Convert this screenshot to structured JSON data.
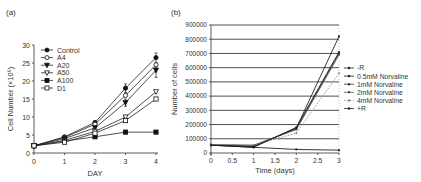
{
  "chart_data": [
    {
      "panel": "(a)",
      "type": "line",
      "title": "",
      "xlabel": "DAY",
      "ylabel": "Cell Number (×10⁶)",
      "x": [
        0,
        1,
        2,
        3,
        4
      ],
      "xticks": [
        "0",
        "1",
        "2",
        "3",
        "4"
      ],
      "yticks": [
        "0",
        "5",
        "10",
        "15",
        "20",
        "25",
        "30"
      ],
      "ylim": [
        0,
        30
      ],
      "xlim": [
        0,
        4
      ],
      "grid": false,
      "legend_position": "upper-left-inside",
      "series": [
        {
          "name": "Control",
          "marker": "filled-circle",
          "values": [
            2,
            4.5,
            8.5,
            18,
            26.5
          ]
        },
        {
          "name": "A4",
          "marker": "open-circle",
          "values": [
            2,
            4.3,
            8,
            16,
            24.5
          ]
        },
        {
          "name": "A20",
          "marker": "filled-triangle-down",
          "values": [
            2,
            4,
            7,
            14,
            23
          ]
        },
        {
          "name": "A50",
          "marker": "open-triangle-down",
          "values": [
            2,
            3.5,
            6,
            10,
            17
          ]
        },
        {
          "name": "A100",
          "marker": "filled-square",
          "values": [
            2,
            3.3,
            4.5,
            5.8,
            5.8
          ]
        },
        {
          "name": "D1",
          "marker": "open-square",
          "values": [
            2,
            3,
            5.5,
            9,
            15
          ]
        }
      ]
    },
    {
      "panel": "(b)",
      "type": "line",
      "title": "",
      "xlabel": "Time (days)",
      "ylabel": "Number of cells",
      "x": [
        0,
        1,
        2,
        3
      ],
      "xticks": [
        "0",
        "0.5",
        "1",
        "1.5",
        "2",
        "2.5",
        "3"
      ],
      "yticks": [
        "0",
        "100000",
        "200000",
        "300000",
        "400000",
        "500000",
        "600000",
        "700000",
        "800000",
        "900000"
      ],
      "ylim": [
        0,
        900000
      ],
      "xlim": [
        0,
        3
      ],
      "grid": true,
      "legend_position": "right-outside",
      "series": [
        {
          "name": "-R",
          "values": [
            55000,
            40000,
            25000,
            20000
          ]
        },
        {
          "name": "0.5mM Norvaline",
          "values": [
            55000,
            40000,
            180000,
            710000
          ]
        },
        {
          "name": "1mM Norvaline",
          "values": [
            55000,
            50000,
            170000,
            700000
          ]
        },
        {
          "name": "2mM Norvaline",
          "values": [
            60000,
            55000,
            165000,
            690000
          ]
        },
        {
          "name": "4mM Norvaline",
          "values": [
            60000,
            55000,
            140000,
            560000
          ]
        },
        {
          "name": "+R",
          "values": [
            55000,
            45000,
            175000,
            820000
          ]
        }
      ]
    }
  ],
  "labels": {
    "panel_a": "(a)",
    "panel_b": "(b)",
    "a_xlabel": "DAY",
    "a_ylabel": "Cell Number (×10⁶)",
    "b_xlabel": "Time (days)",
    "b_ylabel": "Number of cells"
  }
}
